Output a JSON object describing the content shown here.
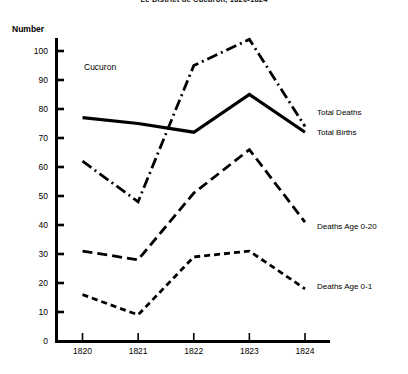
{
  "chart_data": {
    "type": "line",
    "title": "Le District de Cucuron, 1820-1824",
    "annotation": "Cucuron",
    "xlabel": "",
    "ylabel": "Number",
    "categories": [
      "1820",
      "1821",
      "1822",
      "1823",
      "1824"
    ],
    "x": [
      1820,
      1821,
      1822,
      1823,
      1824
    ],
    "ylim": [
      0,
      100
    ],
    "yticks": [
      0,
      10,
      20,
      30,
      40,
      50,
      60,
      70,
      80,
      90,
      100
    ],
    "ytick_labels": [
      "0",
      "10",
      "20",
      "30",
      "40",
      "50",
      "60",
      "70",
      "80",
      "90",
      "100"
    ],
    "grid": false,
    "legend_position": "right-inline",
    "series": [
      {
        "name": "Total Deaths",
        "style": "dash-dot",
        "color": "#000000",
        "values": [
          62,
          48,
          95,
          104,
          74
        ]
      },
      {
        "name": "Total Births",
        "style": "solid",
        "color": "#000000",
        "values": [
          77,
          75,
          72,
          85,
          72
        ]
      },
      {
        "name": "Deaths Age 0-20",
        "style": "long-dash",
        "color": "#000000",
        "values": [
          31,
          28,
          51,
          66,
          41
        ]
      },
      {
        "name": "Deaths Age 0-1",
        "style": "short-dash",
        "color": "#000000",
        "values": [
          16,
          9,
          29,
          31,
          18
        ]
      }
    ]
  },
  "axis": {
    "y_axis_name": "Number",
    "x_axis_name": ""
  }
}
